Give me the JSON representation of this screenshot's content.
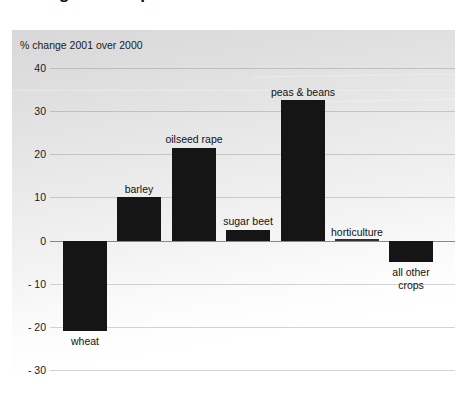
{
  "figure": {
    "title_cropped": "Changes in crop areas",
    "axis_caption": "% change 2001 over 2000",
    "background_note": "grey-to-white vertical gradient scan"
  },
  "chart_data": {
    "type": "bar",
    "title": "% change 2001 over 2000",
    "xlabel": "",
    "ylabel": "% change 2001 over 2000",
    "ylim": [
      -30,
      40
    ],
    "yticks": [
      40,
      30,
      20,
      10,
      0,
      -10,
      -20,
      -30
    ],
    "ytick_labels": [
      "40",
      "30",
      "20",
      "10",
      "0",
      "- 10",
      "- 20",
      "- 30"
    ],
    "grid": true,
    "legend": "none",
    "bar_color": "#151515",
    "categories": [
      "wheat",
      "barley",
      "oilseed rape",
      "sugar beet",
      "peas & beans",
      "horticulture",
      "all other crops"
    ],
    "values": [
      -21,
      10,
      21.5,
      2.5,
      32.5,
      0,
      -5
    ],
    "labels": [
      {
        "text": "wheat",
        "lines": [
          "wheat"
        ],
        "position": "below-bar"
      },
      {
        "text": "barley",
        "lines": [
          "barley"
        ],
        "position": "above-bar"
      },
      {
        "text": "oilseed rape",
        "lines": [
          "oilseed rape"
        ],
        "position": "above-bar"
      },
      {
        "text": "sugar beet",
        "lines": [
          "sugar beet"
        ],
        "position": "above-bar"
      },
      {
        "text": "peas & beans",
        "lines": [
          "peas & beans"
        ],
        "position": "above-bar"
      },
      {
        "text": "horticulture",
        "lines": [
          "horticulture"
        ],
        "position": "above-bar"
      },
      {
        "text": "all other crops",
        "lines": [
          "all other",
          "crops"
        ],
        "position": "below-bar"
      }
    ]
  }
}
